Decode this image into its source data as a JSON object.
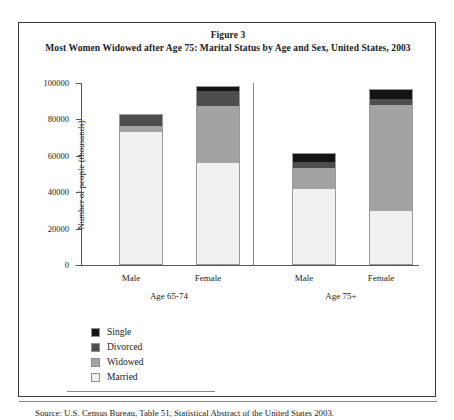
{
  "figure": {
    "title_line1": "Figure 3",
    "title_line2": "Most Women Widowed after Age 75: Marital Status by Age and Sex, United States, 2003",
    "source": "Source: U.S. Census Bureau, Table 51, Statistical Abstract of the United States 2003."
  },
  "colors": {
    "single": "#141414",
    "divorced": "#4d4d4d",
    "widowed": "#a3a3a3",
    "married": "#f1f1f1",
    "frame": "#3a3a3a",
    "axis": "#555555",
    "bar_border": "#9a9a9a"
  },
  "legend": {
    "items": [
      {
        "label": "Single",
        "key": "single"
      },
      {
        "label": "Divorced",
        "key": "divorced"
      },
      {
        "label": "Widowed",
        "key": "widowed"
      },
      {
        "label": "Married",
        "key": "married"
      }
    ]
  },
  "axis": {
    "ylabel": "Number of people (thousands)",
    "yticks": [
      "100000",
      "80000",
      "60000",
      "40000",
      "20000",
      "0"
    ]
  },
  "groups": [
    {
      "label": "Age 65-74",
      "bars": [
        "Male",
        "Female"
      ]
    },
    {
      "label": "Age 75+",
      "bars": [
        "Male",
        "Female"
      ]
    }
  ],
  "chart_data": {
    "type": "bar",
    "subtype": "stacked",
    "title": "Most Women Widowed after Age 75: Marital Status by Age and Sex, United States, 2003",
    "xlabel": "",
    "ylabel": "Number of people (thousands)",
    "ylim": [
      0,
      100000
    ],
    "ytick_interval": 20000,
    "yticks": [
      0,
      20000,
      40000,
      60000,
      80000,
      100000
    ],
    "grid": false,
    "legend_position": "below-left",
    "group_labels": [
      "Age 65-74",
      "Age 75+"
    ],
    "categories": [
      "Male (65-74)",
      "Female (65-74)",
      "Male (75+)",
      "Female (75+)"
    ],
    "series": [
      {
        "name": "Married",
        "values": [
          72500,
          55300,
          41000,
          29200
        ]
      },
      {
        "name": "Widowed",
        "values": [
          3300,
          31700,
          11800,
          58400
        ]
      },
      {
        "name": "Divorced",
        "values": [
          6200,
          8000,
          3200,
          3100
        ]
      },
      {
        "name": "Single",
        "values": [
          0,
          2500,
          4200,
          5000
        ]
      }
    ],
    "totals": [
      82000,
      97500,
      60200,
      95700
    ]
  }
}
